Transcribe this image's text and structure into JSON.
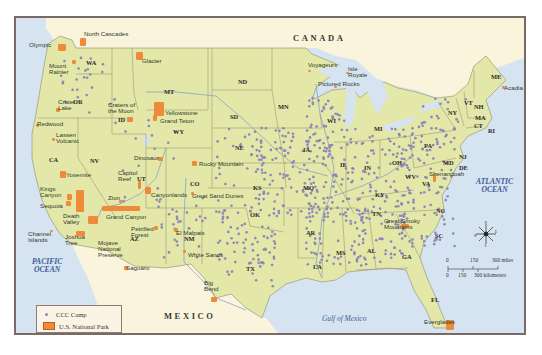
{
  "map": {
    "colors": {
      "land_us": "#e3e7a8",
      "land_foreign": "#fbf4dc",
      "water": "#d6e4f1",
      "border": "#7a6a66",
      "state_line": "#8e8a70",
      "ccc_camp": "#8d87b8",
      "national_park": "#ef8a3a"
    },
    "countries": [
      {
        "name": "CANADA",
        "x": 277,
        "y": 16
      },
      {
        "name": "MEXICO",
        "x": 148,
        "y": 294
      }
    ],
    "water_bodies": [
      {
        "name": "PACIFIC\nOCEAN",
        "x": 16,
        "y": 240,
        "ocean": true
      },
      {
        "name": "ATLANTIC\nOCEAN",
        "x": 460,
        "y": 160,
        "ocean": true
      },
      {
        "name": "Gulf of Mexico",
        "x": 306,
        "y": 297,
        "ocean": false
      }
    ],
    "states": [
      {
        "abbr": "WA",
        "x": 70,
        "y": 42
      },
      {
        "abbr": "OR",
        "x": 57,
        "y": 81
      },
      {
        "abbr": "CA",
        "x": 33,
        "y": 139
      },
      {
        "abbr": "NV",
        "x": 74,
        "y": 140
      },
      {
        "abbr": "ID",
        "x": 102,
        "y": 99
      },
      {
        "abbr": "MT",
        "x": 148,
        "y": 71
      },
      {
        "abbr": "WY",
        "x": 157,
        "y": 111
      },
      {
        "abbr": "UT",
        "x": 121,
        "y": 158
      },
      {
        "abbr": "AZ",
        "x": 114,
        "y": 218
      },
      {
        "abbr": "NM",
        "x": 168,
        "y": 218
      },
      {
        "abbr": "CO",
        "x": 174,
        "y": 163
      },
      {
        "abbr": "ND",
        "x": 222,
        "y": 61
      },
      {
        "abbr": "SD",
        "x": 214,
        "y": 96
      },
      {
        "abbr": "NE",
        "x": 219,
        "y": 127
      },
      {
        "abbr": "KS",
        "x": 237,
        "y": 167
      },
      {
        "abbr": "OK",
        "x": 234,
        "y": 194
      },
      {
        "abbr": "TX",
        "x": 230,
        "y": 248
      },
      {
        "abbr": "MN",
        "x": 262,
        "y": 86
      },
      {
        "abbr": "IA",
        "x": 287,
        "y": 129
      },
      {
        "abbr": "MO",
        "x": 287,
        "y": 167
      },
      {
        "abbr": "AR",
        "x": 290,
        "y": 212
      },
      {
        "abbr": "LA",
        "x": 297,
        "y": 246
      },
      {
        "abbr": "WI",
        "x": 311,
        "y": 100
      },
      {
        "abbr": "IL",
        "x": 324,
        "y": 144
      },
      {
        "abbr": "MS",
        "x": 320,
        "y": 232
      },
      {
        "abbr": "MI",
        "x": 358,
        "y": 108
      },
      {
        "abbr": "IN",
        "x": 348,
        "y": 147
      },
      {
        "abbr": "KY",
        "x": 359,
        "y": 174
      },
      {
        "abbr": "TN",
        "x": 356,
        "y": 193
      },
      {
        "abbr": "AL",
        "x": 351,
        "y": 230
      },
      {
        "abbr": "OH",
        "x": 376,
        "y": 142
      },
      {
        "abbr": "GA",
        "x": 386,
        "y": 236
      },
      {
        "abbr": "FL",
        "x": 415,
        "y": 279
      },
      {
        "abbr": "SC",
        "x": 419,
        "y": 215
      },
      {
        "abbr": "NC",
        "x": 420,
        "y": 190
      },
      {
        "abbr": "VA",
        "x": 406,
        "y": 163
      },
      {
        "abbr": "WV",
        "x": 389,
        "y": 156
      },
      {
        "abbr": "PA",
        "x": 408,
        "y": 125
      },
      {
        "abbr": "NY",
        "x": 432,
        "y": 92
      },
      {
        "abbr": "MD",
        "x": 427,
        "y": 142
      },
      {
        "abbr": "DE",
        "x": 443,
        "y": 147
      },
      {
        "abbr": "NJ",
        "x": 443,
        "y": 136
      },
      {
        "abbr": "VT",
        "x": 448,
        "y": 82
      },
      {
        "abbr": "NH",
        "x": 458,
        "y": 86
      },
      {
        "abbr": "MA",
        "x": 459,
        "y": 97
      },
      {
        "abbr": "CT",
        "x": 458,
        "y": 105
      },
      {
        "abbr": "RI",
        "x": 472,
        "y": 110
      },
      {
        "abbr": "ME",
        "x": 475,
        "y": 56
      }
    ],
    "national_parks": [
      {
        "name": "Olympic",
        "lx": 13,
        "ly": 24,
        "px": 42,
        "py": 26,
        "w": 8,
        "h": 7
      },
      {
        "name": "North Cascades",
        "lx": 68,
        "ly": 13,
        "px": 64,
        "py": 20,
        "w": 6,
        "h": 8
      },
      {
        "name": "Mount\nRainier",
        "lx": 33,
        "ly": 45,
        "px": 56,
        "py": 42,
        "w": 4,
        "h": 4
      },
      {
        "name": "Glacier",
        "lx": 126,
        "ly": 40,
        "px": 120,
        "py": 34,
        "w": 7,
        "h": 8
      },
      {
        "name": "Crater\nLake",
        "lx": 42,
        "ly": 81,
        "px": 40,
        "py": 90,
        "w": 4,
        "h": 4
      },
      {
        "name": "Craters of\nthe Moon",
        "lx": 92,
        "ly": 84,
        "px": 111,
        "py": 99,
        "w": 6,
        "h": 5
      },
      {
        "name": "Yellowstone",
        "lx": 149,
        "ly": 92,
        "px": 138,
        "py": 84,
        "w": 10,
        "h": 14
      },
      {
        "name": "Grand Teton",
        "lx": 144,
        "ly": 100,
        "px": 137,
        "py": 97,
        "w": 4,
        "h": 6
      },
      {
        "name": "Redwood",
        "lx": 21,
        "ly": 103,
        "px": 20,
        "py": 106,
        "w": 3,
        "h": 3
      },
      {
        "name": "Lassen\nVolcanic",
        "lx": 40,
        "ly": 114,
        "px": 36,
        "py": 120,
        "w": 3,
        "h": 3
      },
      {
        "name": "Yosemite",
        "lx": 50,
        "ly": 154,
        "px": 44,
        "py": 153,
        "w": 6,
        "h": 7
      },
      {
        "name": "Kings\nCanyon",
        "lx": 24,
        "ly": 168,
        "px": 51,
        "py": 176,
        "w": 5,
        "h": 6
      },
      {
        "name": "Sequoia",
        "lx": 24,
        "ly": 185,
        "px": 50,
        "py": 183,
        "w": 5,
        "h": 5
      },
      {
        "name": "Death\nValley",
        "lx": 47,
        "ly": 195,
        "px": 60,
        "py": 172,
        "w": 8,
        "h": 22
      },
      {
        "name": "Channel\nIslands",
        "lx": 12,
        "ly": 213,
        "px": 34,
        "py": 212,
        "w": 3,
        "h": 2
      },
      {
        "name": "Joshua\nTree",
        "lx": 49,
        "ly": 216,
        "px": 60,
        "py": 213,
        "w": 9,
        "h": 5
      },
      {
        "name": "Mojave\nNational\nPreserve",
        "lx": 82,
        "ly": 222,
        "px": 72,
        "py": 198,
        "w": 10,
        "h": 8
      },
      {
        "name": "Dinosaur",
        "lx": 118,
        "ly": 137,
        "px": 142,
        "py": 139,
        "w": 5,
        "h": 4
      },
      {
        "name": "Capitol\nReef",
        "lx": 102,
        "ly": 152,
        "px": 122,
        "py": 163,
        "w": 3,
        "h": 8
      },
      {
        "name": "Canyonlands",
        "lx": 135,
        "ly": 174,
        "px": 129,
        "py": 169,
        "w": 6,
        "h": 7
      },
      {
        "name": "Zion",
        "lx": 92,
        "ly": 177,
        "px": 103,
        "py": 182,
        "w": 3,
        "h": 3
      },
      {
        "name": "Grand Canyon",
        "lx": 90,
        "ly": 196,
        "px": 86,
        "py": 188,
        "w": 38,
        "h": 5
      },
      {
        "name": "Petrified\nForest",
        "lx": 115,
        "ly": 208,
        "px": 138,
        "py": 208,
        "w": 4,
        "h": 4
      },
      {
        "name": "Saguaro",
        "lx": 110,
        "ly": 247,
        "px": 108,
        "py": 248,
        "w": 4,
        "h": 4
      },
      {
        "name": "Rocky Mountain",
        "lx": 183,
        "ly": 143,
        "px": 176,
        "py": 143,
        "w": 5,
        "h": 5
      },
      {
        "name": "Great Sand Dunes",
        "lx": 176,
        "ly": 175,
        "px": 175,
        "py": 174,
        "w": 3,
        "h": 3
      },
      {
        "name": "El Malpais",
        "lx": 160,
        "ly": 212,
        "px": 158,
        "py": 210,
        "w": 4,
        "h": 4
      },
      {
        "name": "White Sands",
        "lx": 172,
        "ly": 234,
        "px": 167,
        "py": 232,
        "w": 3,
        "h": 3
      },
      {
        "name": "Big\nBend",
        "lx": 188,
        "ly": 262,
        "px": 195,
        "py": 279,
        "w": 6,
        "h": 5
      },
      {
        "name": "Voyageurs",
        "lx": 292,
        "ly": 44,
        "px": 292,
        "py": 52,
        "w": 3,
        "h": 2
      },
      {
        "name": "Isle\nRoyale",
        "lx": 332,
        "ly": 48,
        "px": 330,
        "py": 54,
        "w": 3,
        "h": 2
      },
      {
        "name": "Pictured Rocks",
        "lx": 302,
        "ly": 63,
        "px": 318,
        "py": 68,
        "w": 3,
        "h": 2
      },
      {
        "name": "Great Smoky\nMountains",
        "lx": 368,
        "ly": 200,
        "px": 385,
        "py": 206,
        "w": 8,
        "h": 4
      },
      {
        "name": "Shenandoah",
        "lx": 413,
        "ly": 153,
        "px": 417,
        "py": 156,
        "w": 3,
        "h": 8
      },
      {
        "name": "Acadia",
        "lx": 488,
        "ly": 67,
        "px": 486,
        "py": 68,
        "w": 3,
        "h": 3
      },
      {
        "name": "Everglades",
        "lx": 408,
        "ly": 301,
        "px": 430,
        "py": 302,
        "w": 8,
        "h": 10
      }
    ],
    "legend": {
      "items": [
        {
          "label": "CCC Camp",
          "symbol": "dot"
        },
        {
          "label": "U.S. National Park",
          "symbol": "swatch"
        }
      ]
    },
    "compass": {
      "n": "N",
      "s": "S",
      "e": "E",
      "w": "W"
    },
    "scale_bar": {
      "miles_ticks": [
        "0",
        "150",
        "300 miles"
      ],
      "km_ticks": [
        "0",
        "150",
        "300 kilometers"
      ]
    }
  }
}
